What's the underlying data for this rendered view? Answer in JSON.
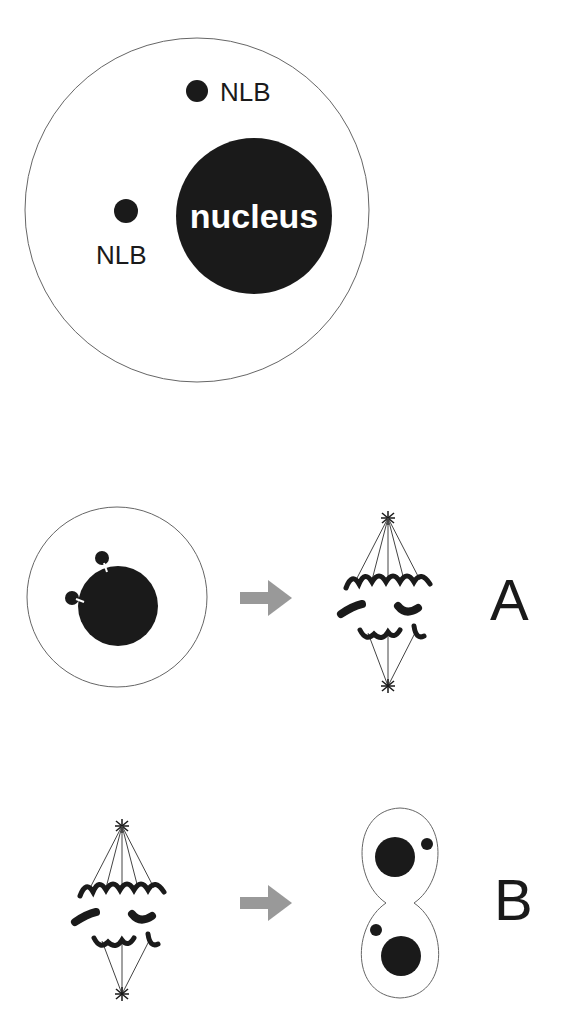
{
  "figure": {
    "top_cell": {
      "nucleus_label": "nucleus",
      "nlb_labels": [
        "NLB",
        "NLB"
      ]
    },
    "panels": [
      {
        "id": "A",
        "label": "A",
        "from": "cell with NLBs attached to nucleus",
        "to": "mitotic spindle"
      },
      {
        "id": "B",
        "label": "B",
        "from": "mitotic spindle",
        "to": "dividing cell with two nuclei and NLBs"
      }
    ],
    "colors": {
      "ink": "#1a1a1a",
      "outline": "#555555",
      "arrow": "#999999",
      "background": "#ffffff"
    }
  }
}
